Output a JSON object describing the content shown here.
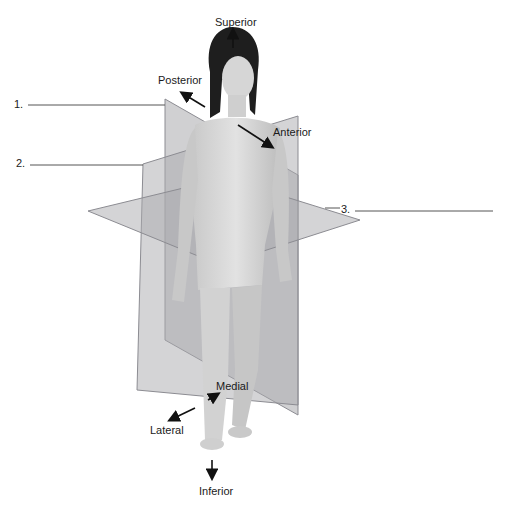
{
  "figure": {
    "directions": {
      "superior": "Superior",
      "inferior": "Inferior",
      "anterior": "Anterior",
      "posterior": "Posterior",
      "medial": "Medial",
      "lateral": "Lateral"
    },
    "blanks": [
      {
        "number": "1.",
        "answer": ""
      },
      {
        "number": "2.",
        "answer": ""
      },
      {
        "number": "3.",
        "answer": ""
      }
    ],
    "colors": {
      "plane_fill": "#a9a9ad",
      "plane_edge": "#8c8c92",
      "body": "#d8d8d8",
      "body_shadow": "#b9b9b9",
      "hair": "#1e1e1e",
      "text": "#1a1a1a"
    }
  }
}
